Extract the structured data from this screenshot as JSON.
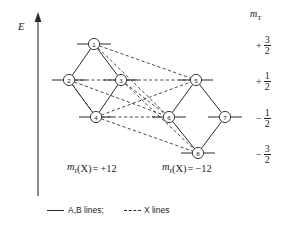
{
  "figure": {
    "axis": {
      "energy_label": "E",
      "arrow_direction": "up"
    },
    "right_header": {
      "symbol": "m",
      "subscript": "T"
    },
    "right_levels": [
      {
        "id": "level-plus-3-2",
        "sign": "+",
        "numerator": "3",
        "denominator": "2",
        "y": 44
      },
      {
        "id": "level-plus-1-2",
        "sign": "+",
        "numerator": "1",
        "denominator": "2",
        "y": 80
      },
      {
        "id": "level-minus-1-2",
        "sign": "−",
        "numerator": "1",
        "denominator": "2",
        "y": 117
      },
      {
        "id": "level-minus-3-2",
        "sign": "−",
        "numerator": "3",
        "denominator": "2",
        "y": 153
      }
    ],
    "group_labels": [
      {
        "id": "group-left",
        "symbol": "m",
        "subscript": "I",
        "argument": "(X)",
        "equals": "=",
        "sign": "+",
        "numerator": "1",
        "denominator": "2",
        "x": 67,
        "y": 170
      },
      {
        "id": "group-right",
        "symbol": "m",
        "subscript": "I",
        "argument": "(X)",
        "equals": "=",
        "sign": "−",
        "numerator": "1",
        "denominator": "2",
        "x": 162,
        "y": 170
      }
    ],
    "legend": {
      "solid_label": "A,B lines;",
      "dashed_label": "X lines"
    },
    "nodes": [
      {
        "id": "node-1",
        "label": "1",
        "x": 94,
        "y": 44
      },
      {
        "id": "node-2",
        "label": "2",
        "x": 69,
        "y": 80
      },
      {
        "id": "node-3",
        "label": "3",
        "x": 121,
        "y": 80
      },
      {
        "id": "node-4",
        "label": "4",
        "x": 96,
        "y": 117
      },
      {
        "id": "node-5",
        "label": "5",
        "x": 196,
        "y": 80
      },
      {
        "id": "node-6",
        "label": "6",
        "x": 169,
        "y": 117
      },
      {
        "id": "node-7",
        "label": "7",
        "x": 225,
        "y": 117
      },
      {
        "id": "node-8",
        "label": "8",
        "x": 198,
        "y": 153
      }
    ],
    "solid_edges": [
      [
        "node-1",
        "node-2"
      ],
      [
        "node-1",
        "node-3"
      ],
      [
        "node-2",
        "node-4"
      ],
      [
        "node-3",
        "node-4"
      ],
      [
        "node-5",
        "node-6"
      ],
      [
        "node-5",
        "node-7"
      ],
      [
        "node-6",
        "node-8"
      ],
      [
        "node-7",
        "node-8"
      ]
    ],
    "dashed_edges": [
      [
        "node-1",
        "node-5"
      ],
      [
        "node-1",
        "node-6"
      ],
      [
        "node-2",
        "node-4"
      ],
      [
        "node-2",
        "node-6"
      ],
      [
        "node-3",
        "node-5"
      ],
      [
        "node-3",
        "node-6"
      ],
      [
        "node-3",
        "node-8"
      ],
      [
        "node-4",
        "node-5"
      ],
      [
        "node-4",
        "node-6"
      ],
      [
        "node-4",
        "node-8"
      ],
      [
        "node-2",
        "node-3"
      ]
    ],
    "style": {
      "line_color": "#2a2a2a",
      "node_fill": "#ffffff",
      "text_color": "#232323"
    }
  }
}
